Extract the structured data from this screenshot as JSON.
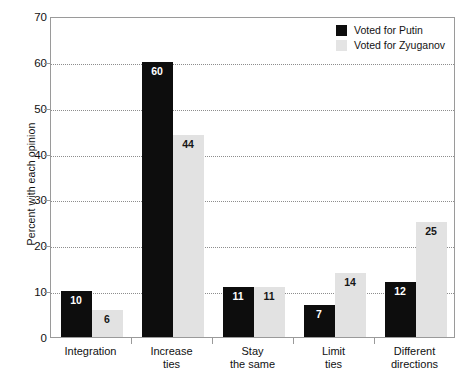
{
  "chart_data": {
    "type": "bar",
    "title": "",
    "subtitle": "",
    "xlabel": "",
    "ylabel": "Percent with each opinion",
    "ylim": [
      0,
      70
    ],
    "yticks": [
      0,
      10,
      20,
      30,
      40,
      50,
      60,
      70
    ],
    "ytick_labels": [
      "0",
      "10",
      "20",
      "30",
      "40",
      "50",
      "60",
      "70"
    ],
    "grid": "horizontal-dotted",
    "legend_position": "top-right",
    "categories": [
      [
        "Integration"
      ],
      [
        "Increase",
        "ties"
      ],
      [
        "Stay",
        "the same"
      ],
      [
        "Limit",
        "ties"
      ],
      [
        "Different",
        "directions"
      ]
    ],
    "series": [
      {
        "name": "Voted for Putin",
        "color": "#0d0d0d",
        "values": [
          10,
          60,
          11,
          7,
          12
        ]
      },
      {
        "name": "Voted for Zyuganov",
        "color": "#e2e2e2",
        "values": [
          6,
          44,
          11,
          14,
          25
        ]
      }
    ]
  },
  "legend": {
    "items": [
      {
        "label": "Voted for Putin",
        "swatch": "dark"
      },
      {
        "label": "Voted for Zyuganov",
        "swatch": "light"
      }
    ]
  },
  "axes": {
    "y_title": "Percent with each opinion"
  }
}
